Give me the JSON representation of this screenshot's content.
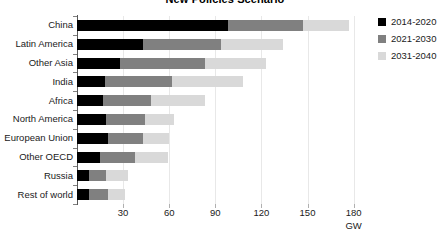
{
  "chart_data": {
    "type": "bar",
    "orientation": "horizontal",
    "stacked": true,
    "title": "New Policies Scenario",
    "xlabel": "GW",
    "ylabel": "",
    "xlim": [
      0,
      190
    ],
    "xticks": [
      30,
      60,
      90,
      120,
      150,
      180
    ],
    "grid": true,
    "legend_position": "right",
    "categories": [
      "China",
      "Latin America",
      "Other Asia",
      "India",
      "Africa",
      "North America",
      "European Union",
      "Other OECD",
      "Russia",
      "Rest of world"
    ],
    "series": [
      {
        "name": "2014-2020",
        "color": "#000000",
        "values": [
          98,
          43,
          28,
          18,
          17,
          19,
          20,
          15,
          8,
          8
        ]
      },
      {
        "name": "2021-2030",
        "color": "#808080",
        "values": [
          49,
          51,
          55,
          44,
          31,
          25,
          23,
          23,
          11,
          12
        ]
      },
      {
        "name": "2031-2040",
        "color": "#d9d9d9",
        "values": [
          30,
          40,
          40,
          46,
          35,
          19,
          17,
          21,
          14,
          11
        ]
      }
    ],
    "totals": [
      177,
      134,
      123,
      108,
      83,
      63,
      60,
      59,
      33,
      31
    ]
  },
  "legend": {
    "items": [
      {
        "label": "2014-2020",
        "color": "#000000"
      },
      {
        "label": "2021-2030",
        "color": "#808080"
      },
      {
        "label": "2031-2040",
        "color": "#d9d9d9"
      }
    ]
  },
  "axis": {
    "unit": "GW",
    "tick_labels": [
      "30",
      "60",
      "90",
      "120",
      "150",
      "180"
    ]
  }
}
